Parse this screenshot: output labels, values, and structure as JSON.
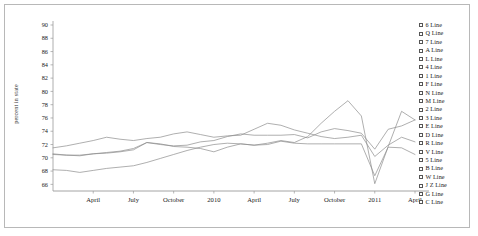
{
  "chart_data": {
    "type": "line",
    "title": "",
    "xlabel": "",
    "ylabel": "percent in state",
    "ylim": [
      65,
      90
    ],
    "yticks": [
      66,
      68,
      70,
      72,
      74,
      76,
      78,
      80,
      82,
      84,
      86,
      88,
      90
    ],
    "grid": false,
    "legend_position": "right",
    "x": [
      "Jan 2009",
      "Feb 2009",
      "Mar 2009",
      "April",
      "May 2009",
      "Jun 2009",
      "July",
      "Aug 2009",
      "Sep 2009",
      "October",
      "Nov 2009",
      "Dec 2009",
      "2010",
      "Feb 2010",
      "Mar 2010",
      "April",
      "May 2010",
      "Jun 2010",
      "July",
      "Aug 2010",
      "Sep 2010",
      "October",
      "Nov 2010",
      "Dec 2010",
      "2011",
      "Feb 2011",
      "Mar 2011",
      "April"
    ],
    "xtick_labels": [
      "April",
      "July",
      "October",
      "2010",
      "April",
      "July",
      "October",
      "2011",
      "April"
    ],
    "xtick_positions": [
      3,
      6,
      9,
      12,
      15,
      18,
      21,
      24,
      27
    ],
    "series": [
      {
        "name": "6 Line",
        "color": "#8c8c8c",
        "values": [
          71.5,
          71.8,
          72.2,
          72.6,
          73.1,
          72.8,
          72.6,
          72.9,
          73.1,
          73.6,
          73.9,
          73.5,
          73.1,
          73.3,
          73.4,
          74.3,
          75.2,
          74.9,
          74.2,
          73.7,
          73.2,
          72.9,
          73.1,
          73.4,
          70.2,
          71.9,
          73.1,
          72.4
        ]
      },
      {
        "name": "Q Line",
        "color": "#8c8c8c",
        "values": [
          70.6,
          70.4,
          70.3,
          70.6,
          70.7,
          70.9,
          71.2,
          72.3,
          72.1,
          71.7,
          71.6,
          71.4,
          70.9,
          71.6,
          72.1,
          71.9,
          72.0,
          72.5,
          72.2,
          72.1,
          72.1,
          72.1,
          72.1,
          72.1,
          67.3,
          71.6,
          71.5,
          70.5
        ]
      },
      {
        "name": "7 Line",
        "color": "#8c8c8c",
        "values": [
          70.5,
          70.4,
          70.4,
          70.6,
          70.8,
          71.0,
          71.4,
          72.3,
          72.0,
          71.8,
          71.9,
          72.4,
          72.6,
          73.2,
          73.6,
          73.4,
          73.4,
          73.4,
          73.5,
          73.0,
          73.9,
          74.4,
          74.1,
          73.7,
          71.3,
          74.3,
          74.8,
          75.7
        ]
      },
      {
        "name": "A Line",
        "color": "#8c8c8c",
        "values": [
          68.2,
          68.1,
          67.8,
          68.1,
          68.4,
          68.6,
          68.8,
          69.3,
          69.9,
          70.5,
          71.1,
          71.6,
          72.0,
          72.2,
          72.1,
          71.9,
          72.2,
          72.6,
          72.3,
          73.2,
          75.2,
          77.0,
          78.6,
          76.3,
          66.1,
          71.7,
          77.0,
          75.7
        ]
      }
    ]
  },
  "legend": {
    "items": [
      {
        "label": "6 Line"
      },
      {
        "label": "Q Line"
      },
      {
        "label": "7 Line"
      },
      {
        "label": "A Line"
      },
      {
        "label": "L Line"
      },
      {
        "label": "4 Line"
      },
      {
        "label": "1 Line"
      },
      {
        "label": "F Line"
      },
      {
        "label": "N Line"
      },
      {
        "label": "M Line"
      },
      {
        "label": "2 Line"
      },
      {
        "label": "3 Line"
      },
      {
        "label": "E Line"
      },
      {
        "label": "D Line"
      },
      {
        "label": "R Line"
      },
      {
        "label": "V Line"
      },
      {
        "label": "5 Line"
      },
      {
        "label": "B Line"
      },
      {
        "label": "W Line"
      },
      {
        "label": "J Z Line"
      },
      {
        "label": "G Line"
      },
      {
        "label": "C Line"
      }
    ]
  },
  "colors": {
    "line": "#8c8c8c",
    "axis": "#9a9a9a",
    "text": "#1a1a1a",
    "frame": "#b8b8b8"
  }
}
